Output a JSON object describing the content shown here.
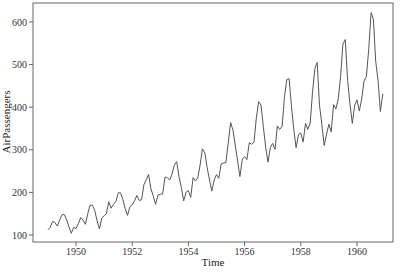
{
  "chart_data": {
    "type": "line",
    "title": "",
    "xlabel": "Time",
    "ylabel": "AirPassengers",
    "xlim": [
      1948.85,
      1961.35
    ],
    "ylim": [
      80,
      645
    ],
    "x_ticks": [
      1950,
      1952,
      1954,
      1956,
      1958,
      1960
    ],
    "x_tick_labels": [
      "1950",
      "1952",
      "1954",
      "1956",
      "1958",
      "1960"
    ],
    "y_ticks": [
      100,
      200,
      300,
      400,
      500,
      600
    ],
    "y_tick_labels": [
      "100",
      "200",
      "300",
      "400",
      "500",
      "600"
    ],
    "grid": false,
    "legend": null,
    "line_color": "#555555",
    "start": 1949,
    "frequency": 12,
    "series": [
      {
        "name": "AirPassengers",
        "values": [
          112,
          118,
          132,
          129,
          121,
          135,
          148,
          148,
          136,
          119,
          104,
          118,
          115,
          126,
          141,
          135,
          125,
          149,
          170,
          170,
          158,
          133,
          114,
          140,
          145,
          150,
          178,
          163,
          172,
          178,
          199,
          199,
          184,
          162,
          146,
          166,
          171,
          180,
          193,
          181,
          183,
          218,
          230,
          242,
          209,
          191,
          172,
          194,
          196,
          196,
          236,
          235,
          229,
          243,
          264,
          272,
          237,
          211,
          180,
          201,
          204,
          188,
          235,
          227,
          234,
          264,
          302,
          293,
          259,
          229,
          203,
          229,
          242,
          233,
          267,
          269,
          270,
          315,
          364,
          347,
          312,
          274,
          237,
          278,
          284,
          277,
          317,
          313,
          318,
          374,
          413,
          405,
          355,
          306,
          271,
          306,
          315,
          301,
          356,
          348,
          355,
          422,
          465,
          467,
          404,
          347,
          305,
          336,
          340,
          318,
          362,
          348,
          363,
          435,
          491,
          505,
          404,
          359,
          310,
          337,
          360,
          342,
          406,
          396,
          420,
          472,
          548,
          559,
          463,
          407,
          362,
          405,
          417,
          391,
          419,
          461,
          472,
          535,
          622,
          606,
          508,
          461,
          390,
          432
        ]
      }
    ]
  }
}
